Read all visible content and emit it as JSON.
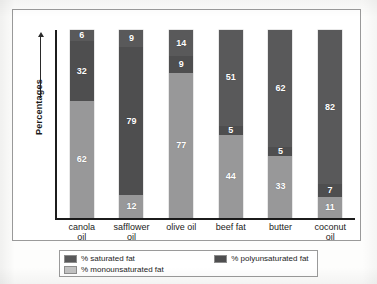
{
  "chart_data": {
    "type": "bar",
    "subtype": "stacked-bar-100",
    "title": "",
    "xlabel": "",
    "ylabel": "Percentages",
    "ylim": [
      0,
      100
    ],
    "grid": false,
    "legend_position": "bottom",
    "stack_order_top_to_bottom": [
      "% saturated fat",
      "% polyunsaturated fat",
      "% monounsaturated fat"
    ],
    "categories": [
      "canola oil",
      "safflower oil",
      "olive oil",
      "beef fat",
      "butter",
      "coconut oil"
    ],
    "series": [
      {
        "name": "% saturated fat",
        "color": "#59595a",
        "values": [
          6,
          9,
          14,
          51,
          62,
          82
        ]
      },
      {
        "name": "% polyunsaturated fat",
        "color": "#4e4e4f",
        "values": [
          32,
          79,
          9,
          5,
          5,
          7
        ]
      },
      {
        "name": "% monounsaturated fat",
        "color": "#989899",
        "values": [
          62,
          12,
          77,
          44,
          33,
          11
        ]
      }
    ]
  },
  "axis": {
    "y_title": "Percentages",
    "x_labels": [
      {
        "line1": "canola",
        "line2": "oil"
      },
      {
        "line1": "safflower",
        "line2": "oil"
      },
      {
        "line1": "olive oil",
        "line2": ""
      },
      {
        "line1": "beef fat",
        "line2": ""
      },
      {
        "line1": "butter",
        "line2": ""
      },
      {
        "line1": "coconut",
        "line2": "oil"
      }
    ]
  },
  "bars": [
    {
      "category": "canola oil",
      "segments": [
        {
          "key": "sat",
          "label": "6",
          "value": 6
        },
        {
          "key": "poly",
          "label": "32",
          "value": 32
        },
        {
          "key": "mono",
          "label": "62",
          "value": 62
        }
      ]
    },
    {
      "category": "safflower oil",
      "segments": [
        {
          "key": "sat",
          "label": "9",
          "value": 9
        },
        {
          "key": "poly",
          "label": "79",
          "value": 79
        },
        {
          "key": "mono",
          "label": "12",
          "value": 12
        }
      ]
    },
    {
      "category": "olive oil",
      "segments": [
        {
          "key": "sat",
          "label": "14",
          "value": 14
        },
        {
          "key": "poly",
          "label": "9",
          "value": 9
        },
        {
          "key": "mono",
          "label": "77",
          "value": 77
        }
      ]
    },
    {
      "category": "beef fat",
      "segments": [
        {
          "key": "sat",
          "label": "51",
          "value": 51
        },
        {
          "key": "poly",
          "label": "5",
          "value": 5
        },
        {
          "key": "mono",
          "label": "44",
          "value": 44
        }
      ]
    },
    {
      "category": "butter",
      "segments": [
        {
          "key": "sat",
          "label": "62",
          "value": 62
        },
        {
          "key": "poly",
          "label": "5",
          "value": 5
        },
        {
          "key": "mono",
          "label": "33",
          "value": 33
        }
      ]
    },
    {
      "category": "coconut oil",
      "segments": [
        {
          "key": "sat",
          "label": "82",
          "value": 82
        },
        {
          "key": "poly",
          "label": "7",
          "value": 7
        },
        {
          "key": "mono",
          "label": "11",
          "value": 11
        }
      ]
    }
  ],
  "legend": {
    "entries": [
      {
        "key": "sat",
        "label": "% saturated fat"
      },
      {
        "key": "poly",
        "label": "% polyunsaturated fat"
      },
      {
        "key": "mono",
        "label": "% monounsaturated fat"
      }
    ]
  },
  "colors": {
    "saturated": "#59595a",
    "polyunsaturated": "#4e4e4f",
    "monounsaturated": "#989899",
    "monounsaturated_swatch": "#c2c2c2",
    "axis": "#1c1c1c",
    "frame": "#9a9a9a",
    "background": "#ffffff"
  }
}
